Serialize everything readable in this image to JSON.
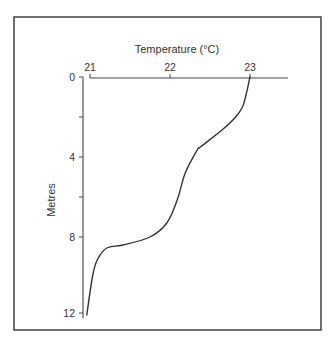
{
  "chart_data": {
    "type": "line",
    "title": "Temperature (°C)",
    "xlabel": "Temperature (°C)",
    "ylabel": "Metres",
    "x_axis_position": "top",
    "y_axis_inverted": true,
    "xlim": [
      21,
      23.5
    ],
    "ylim": [
      0,
      12
    ],
    "x_ticks": [
      21,
      22,
      23
    ],
    "x_tick_labels": [
      "21",
      "22",
      "23"
    ],
    "y_ticks": [
      0,
      2,
      4,
      6,
      8,
      12
    ],
    "y_tick_labels": [
      "0",
      "",
      "4",
      "",
      "8",
      "12"
    ],
    "grid": false,
    "legend": null,
    "series": [
      {
        "name": "Temperature profile",
        "x": [
          23.0,
          22.95,
          22.9,
          22.81,
          22.65,
          22.38,
          22.34,
          22.19,
          22.09,
          21.96,
          21.75,
          21.41,
          21.21,
          21.09,
          21.03,
          20.96
        ],
        "y": [
          0,
          0.9,
          1.55,
          2.05,
          2.65,
          3.5,
          3.65,
          4.8,
          6.15,
          7.3,
          8.0,
          8.4,
          8.55,
          9.15,
          10.0,
          11.9
        ]
      }
    ]
  },
  "labels": {
    "x_title": "Temperature (°C)",
    "y_title": "Metres",
    "x_tick_21": "21",
    "x_tick_22": "22",
    "x_tick_23": "23",
    "y_tick_0": "0",
    "y_tick_4": "4",
    "y_tick_8": "8",
    "y_tick_12": "12"
  },
  "colors": {
    "line": "#333333",
    "axis": "#444444",
    "frame": "#333333",
    "background": "#ffffff"
  }
}
